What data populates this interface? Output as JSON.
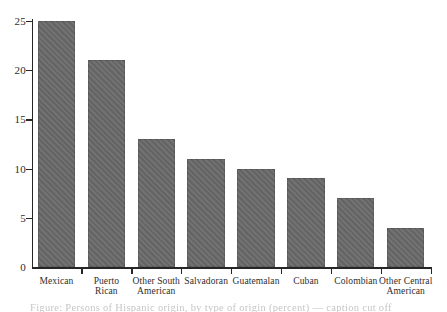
{
  "figure": {
    "background_color": "#ffffff",
    "bar_color": "#6a6a6a",
    "axis_color": "#262626",
    "label_color": "#2e2e2e"
  },
  "chart_data": {
    "type": "bar",
    "title": "",
    "xlabel": "",
    "ylabel": "",
    "categories": [
      "Mexican",
      "Puerto Rican",
      "Other South American",
      "Salvadoran",
      "Guatemalan",
      "Cuban",
      "Colombian",
      "Other Central American"
    ],
    "categories_wrapped": [
      "Mexican",
      "Puerto\nRican",
      "Other South\nAmerican",
      "Salvadoran",
      "Guatemalan",
      "Cuban",
      "Colombian",
      "Other Central\nAmerican"
    ],
    "values": [
      25,
      21,
      13,
      11,
      10,
      9,
      7,
      4
    ],
    "ylim": [
      0,
      25
    ],
    "yticks": [
      0,
      5,
      10,
      15,
      20,
      25
    ],
    "grid": false,
    "legend": "none"
  },
  "footer": {
    "caption_fragment": "Figure: Persons of Hispanic origin, by type of origin (percent) — caption cut off"
  }
}
